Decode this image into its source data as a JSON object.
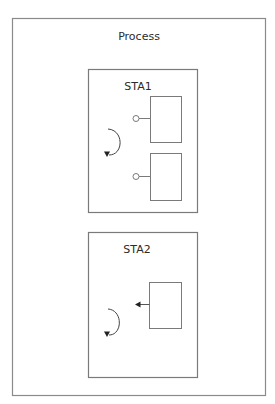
{
  "diagram": {
    "process": {
      "label": "Process"
    },
    "states": [
      {
        "label": "STA1",
        "components": [
          {
            "type": "box-with-lollipop-port"
          },
          {
            "type": "box-with-lollipop-port"
          }
        ],
        "loop": "self-loop-arrow"
      },
      {
        "label": "STA2",
        "components": [
          {
            "type": "box-with-outgoing-arrow"
          }
        ],
        "loop": "self-loop-arrow"
      }
    ],
    "colors": {
      "stroke": "#7a7a7a",
      "text": "#2b2b2b",
      "arrow": "#333333",
      "background": "#ffffff"
    }
  }
}
